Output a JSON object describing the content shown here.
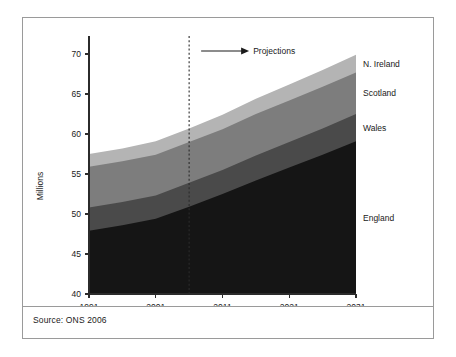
{
  "figure": {
    "source_note": "Source: ONS 2006",
    "annotation": {
      "projections_label": "Projections",
      "projection_start_year": 2006
    }
  },
  "chart_data": {
    "type": "area",
    "stacked": true,
    "title": "",
    "xlabel": "",
    "ylabel": "Millions",
    "x": [
      1991,
      1996,
      2001,
      2006,
      2011,
      2016,
      2021,
      2026,
      2031
    ],
    "xlim": [
      1991,
      2031
    ],
    "ylim": [
      40,
      71.5
    ],
    "xticks": [
      1991,
      2001,
      2011,
      2021,
      2031
    ],
    "xtick_labels": [
      "1991",
      "2001",
      "2011",
      "2021",
      "2031"
    ],
    "yticks": [
      40,
      45,
      50,
      55,
      60,
      65,
      70
    ],
    "ytick_labels": [
      "40",
      "45",
      "50",
      "55",
      "60",
      "65",
      "70"
    ],
    "grid": false,
    "legend_position": "right-inline",
    "series": [
      {
        "name": "England",
        "color": "#151515",
        "values": [
          47.9,
          48.6,
          49.4,
          50.9,
          52.5,
          54.2,
          55.8,
          57.4,
          59.1
        ]
      },
      {
        "name": "Wales",
        "color": "#4a4a4a",
        "values": [
          2.9,
          2.9,
          2.9,
          3.0,
          3.0,
          3.1,
          3.2,
          3.3,
          3.4
        ]
      },
      {
        "name": "Scotland",
        "color": "#7d7d7d",
        "values": [
          5.1,
          5.1,
          5.1,
          5.1,
          5.1,
          5.2,
          5.2,
          5.2,
          5.2
        ]
      },
      {
        "name": "N. Ireland",
        "color": "#b4b4b4",
        "values": [
          1.6,
          1.6,
          1.7,
          1.7,
          1.8,
          1.9,
          2.0,
          2.1,
          2.2
        ]
      }
    ],
    "cumulative_tops": {
      "England": [
        47.9,
        48.6,
        49.4,
        50.9,
        52.5,
        54.2,
        55.8,
        57.4,
        59.1
      ],
      "Wales": [
        50.8,
        51.5,
        52.3,
        53.9,
        55.5,
        57.3,
        59.0,
        60.7,
        62.5
      ],
      "Scotland": [
        55.9,
        56.6,
        57.4,
        59.0,
        60.6,
        62.5,
        64.2,
        65.9,
        67.7
      ],
      "N. Ireland": [
        57.5,
        58.2,
        59.1,
        60.7,
        62.4,
        64.4,
        66.2,
        68.0,
        69.9
      ]
    }
  }
}
